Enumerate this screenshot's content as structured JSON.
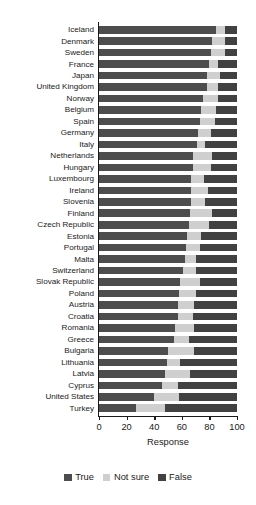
{
  "chart_data": {
    "type": "bar",
    "subtype": "stacked-horizontal-100",
    "title": "",
    "xlabel": "Response",
    "ylabel": "",
    "xlim": [
      0,
      100
    ],
    "xticks": [
      0,
      20,
      40,
      60,
      80,
      100
    ],
    "grid": false,
    "legend_position": "bottom-center",
    "categories": [
      "Iceland",
      "Denmark",
      "Sweden",
      "France",
      "Japan",
      "United Kingdom",
      "Norway",
      "Belgium",
      "Spain",
      "Germany",
      "Italy",
      "Netherlands",
      "Hungary",
      "Luxembourg",
      "Ireland",
      "Slovenia",
      "Finland",
      "Czech Republic",
      "Estonia",
      "Portugal",
      "Malta",
      "Switzerland",
      "Slovak Republic",
      "Poland",
      "Austria",
      "Croatia",
      "Romania",
      "Greece",
      "Bulgaria",
      "Lithuania",
      "Latvia",
      "Cyprus",
      "United States",
      "Turkey"
    ],
    "series": [
      {
        "name": "True",
        "color": "#4d4d4d",
        "values": [
          85,
          82,
          81,
          80,
          78,
          78,
          75,
          74,
          73,
          72,
          71,
          68,
          68,
          67,
          67,
          67,
          66,
          65,
          64,
          63,
          62,
          61,
          59,
          58,
          57,
          57,
          55,
          54,
          50,
          49,
          48,
          46,
          40,
          27
        ]
      },
      {
        "name": "Not sure",
        "color": "#cfcfcf",
        "values": [
          6,
          9,
          10,
          6,
          10,
          8,
          11,
          11,
          11,
          9,
          6,
          14,
          13,
          9,
          12,
          10,
          16,
          15,
          10,
          10,
          8,
          9,
          14,
          12,
          12,
          11,
          14,
          11,
          19,
          10,
          18,
          11,
          18,
          21
        ]
      },
      {
        "name": "False",
        "color": "#414141",
        "values": [
          9,
          9,
          9,
          14,
          12,
          14,
          14,
          15,
          16,
          19,
          23,
          18,
          19,
          24,
          21,
          23,
          18,
          20,
          26,
          27,
          30,
          30,
          27,
          30,
          31,
          32,
          31,
          35,
          31,
          41,
          34,
          43,
          42,
          52
        ]
      }
    ]
  },
  "legend": {
    "items": [
      {
        "label": "True",
        "color": "#4d4d4d"
      },
      {
        "label": "Not sure",
        "color": "#cfcfcf"
      },
      {
        "label": "False",
        "color": "#414141"
      }
    ]
  },
  "axis": {
    "x_title": "Response",
    "x_tick_labels": [
      "0",
      "20",
      "40",
      "60",
      "80",
      "100"
    ]
  }
}
